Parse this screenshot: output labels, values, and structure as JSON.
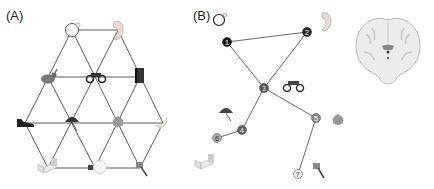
{
  "panels": {
    "a": {
      "label": "(A)",
      "description": "Triangular lattice of objects",
      "objects": [
        {
          "name": "ring",
          "x": 72,
          "y": 30
        },
        {
          "name": "ear",
          "x": 118,
          "y": 30
        },
        {
          "name": "rabbit",
          "x": 48,
          "y": 77
        },
        {
          "name": "motorcycle",
          "x": 95,
          "y": 77
        },
        {
          "name": "book",
          "x": 140,
          "y": 77
        },
        {
          "name": "shoe",
          "x": 25,
          "y": 123
        },
        {
          "name": "umbrella",
          "x": 72,
          "y": 123
        },
        {
          "name": "leaf",
          "x": 118,
          "y": 123
        },
        {
          "name": "banana",
          "x": 163,
          "y": 123
        },
        {
          "name": "bed",
          "x": 48,
          "y": 168
        },
        {
          "name": "lightbulb",
          "x": 95,
          "y": 168
        },
        {
          "name": "hammer",
          "x": 140,
          "y": 168
        }
      ]
    },
    "b": {
      "label": "(B)",
      "description": "Path graph of numbered nodes with objects",
      "nodes": [
        {
          "id": "1",
          "x": 227,
          "y": 42,
          "fill": "#1a1a1a",
          "text": "#ffffff"
        },
        {
          "id": "2",
          "x": 307,
          "y": 32,
          "fill": "#2a2a2a",
          "text": "#ffffff"
        },
        {
          "id": "3",
          "x": 264,
          "y": 88,
          "fill": "#555555",
          "text": "#eeeeee"
        },
        {
          "id": "4",
          "x": 242,
          "y": 130,
          "fill": "#666666",
          "text": "#eeeeee"
        },
        {
          "id": "5",
          "x": 316,
          "y": 118,
          "fill": "#888888",
          "text": "#ffffff"
        },
        {
          "id": "6",
          "x": 217,
          "y": 138,
          "fill": "#aaaaaa",
          "text": "#333333"
        },
        {
          "id": "7",
          "x": 298,
          "y": 174,
          "fill": "#f5f5f5",
          "text": "#333333"
        }
      ],
      "edges": [
        [
          "1",
          "2"
        ],
        [
          "1",
          "3"
        ],
        [
          "2",
          "3"
        ],
        [
          "3",
          "4"
        ],
        [
          "3",
          "5"
        ],
        [
          "4",
          "6"
        ],
        [
          "5",
          "7"
        ]
      ],
      "objects": [
        {
          "name": "ring",
          "x": 219,
          "y": 18
        },
        {
          "name": "ear",
          "x": 327,
          "y": 20
        },
        {
          "name": "motorcycle",
          "x": 294,
          "y": 86
        },
        {
          "name": "umbrella",
          "x": 226,
          "y": 113
        },
        {
          "name": "leaf",
          "x": 338,
          "y": 121
        },
        {
          "name": "bed",
          "x": 205,
          "y": 163
        },
        {
          "name": "hammer",
          "x": 318,
          "y": 172
        }
      ]
    },
    "brain": {
      "description": "Coronal brain MRI slice"
    }
  }
}
